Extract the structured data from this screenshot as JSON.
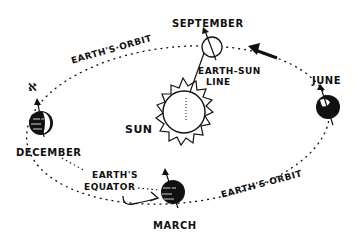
{
  "diagram": {
    "labels": {
      "september": "SEPTEMBER",
      "june": "JUNE",
      "december": "DECEMBER",
      "march": "MARCH",
      "sun": "SUN",
      "earth_sun_line_1": "EARTH-SUN",
      "earth_sun_line_2": "LINE",
      "orbit_top": "EARTH'S·ORBIT",
      "orbit_bottom": "EARTH'S·ORBIT",
      "equator_1": "EARTH'S",
      "equator_2": "EQUATOR",
      "polaris_symbol": "ℵ"
    },
    "colors": {
      "ink": "#111111",
      "background": "#ffffff"
    },
    "arrow_direction": "counterclockwise"
  }
}
